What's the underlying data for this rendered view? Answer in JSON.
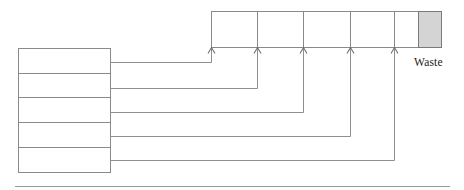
{
  "diagram": {
    "kind": "flow-injection-manifold-diagram",
    "colors": {
      "line": "#8a8a8a",
      "connector": "#8f8f8f",
      "waste_fill": "#d4d4d4",
      "waste_stroke": "#7a7a7a",
      "background": "#ffffff",
      "text": "#1a1a1a",
      "rule": "#9a9a9a"
    },
    "labels": {
      "waste": "Waste"
    },
    "manifold": {
      "name": "top-rail-channel",
      "x_start": 211,
      "x_end": 441,
      "y_top": 11,
      "y_bottom": 47,
      "divider_positions": [
        211,
        257,
        303,
        350,
        394,
        418,
        441
      ],
      "cells": [
        {
          "name": "rail-cell-1",
          "x": 211,
          "width": 46,
          "shaded": false
        },
        {
          "name": "rail-cell-2",
          "x": 257,
          "width": 46,
          "shaded": false
        },
        {
          "name": "rail-cell-3",
          "x": 303,
          "width": 47,
          "shaded": false
        },
        {
          "name": "rail-cell-4",
          "x": 350,
          "width": 44,
          "shaded": false
        },
        {
          "name": "rail-cell-5",
          "x": 394,
          "width": 24,
          "shaded": false
        },
        {
          "name": "rail-cell-waste",
          "x": 418,
          "width": 23,
          "shaded": true
        }
      ]
    },
    "arrows": [
      {
        "name": "inlet-arrow-1",
        "x": 211,
        "tip_y": 47
      },
      {
        "name": "inlet-arrow-2",
        "x": 257,
        "tip_y": 47
      },
      {
        "name": "inlet-arrow-3",
        "x": 303,
        "tip_y": 47
      },
      {
        "name": "inlet-arrow-4",
        "x": 350,
        "tip_y": 47
      },
      {
        "name": "inlet-arrow-5",
        "x": 394,
        "tip_y": 47
      }
    ],
    "source_stack": {
      "name": "reservoir-stack",
      "x": 18,
      "width": 92,
      "y_top": 48,
      "row_height": 24.8,
      "rows": [
        {
          "name": "reservoir-row-1",
          "y": 48,
          "height": 25,
          "outlet_y": 62
        },
        {
          "name": "reservoir-row-2",
          "y": 73,
          "height": 25,
          "outlet_y": 88
        },
        {
          "name": "reservoir-row-3",
          "y": 98,
          "height": 25,
          "outlet_y": 112
        },
        {
          "name": "reservoir-row-4",
          "y": 123,
          "height": 25,
          "outlet_y": 136
        },
        {
          "name": "reservoir-row-5",
          "y": 148,
          "height": 24,
          "outlet_y": 160
        }
      ]
    },
    "connectors": [
      {
        "name": "connector-1",
        "from_row": 1,
        "to_arrow": 1,
        "start_x": 110,
        "start_y": 62,
        "corner_x": 211,
        "end_y": 47
      },
      {
        "name": "connector-2",
        "from_row": 2,
        "to_arrow": 2,
        "start_x": 110,
        "start_y": 88,
        "corner_x": 257,
        "end_y": 47
      },
      {
        "name": "connector-3",
        "from_row": 3,
        "to_arrow": 3,
        "start_x": 110,
        "start_y": 112,
        "corner_x": 303,
        "end_y": 47
      },
      {
        "name": "connector-4",
        "from_row": 4,
        "to_arrow": 4,
        "start_x": 110,
        "start_y": 136,
        "corner_x": 350,
        "end_y": 47
      },
      {
        "name": "connector-5",
        "from_row": 5,
        "to_arrow": 5,
        "start_x": 110,
        "start_y": 160,
        "corner_x": 394,
        "end_y": 47
      }
    ],
    "baseline_rule": {
      "name": "bottom-divider-rule",
      "x_start": 15,
      "x_end": 450,
      "y": 186
    },
    "waste_label_position": {
      "x": 414,
      "y": 66
    }
  }
}
